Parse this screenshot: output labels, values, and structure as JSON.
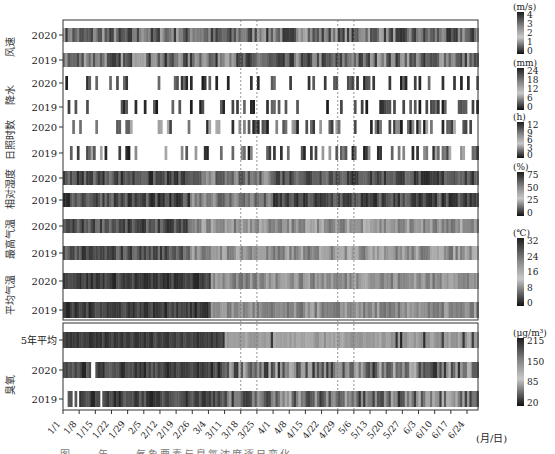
{
  "chart_data": {
    "type": "heatmap",
    "title": "",
    "xlabel": "(月/日)",
    "x_ticks": [
      "1/1",
      "1/8",
      "1/15",
      "1/22",
      "1/29",
      "2/5",
      "2/12",
      "2/19",
      "2/26",
      "3/4",
      "3/11",
      "3/18",
      "3/25",
      "4/1",
      "4/8",
      "4/15",
      "4/22",
      "4/29",
      "5/6",
      "5/13",
      "5/20",
      "5/27",
      "6/3",
      "6/10",
      "6/17",
      "6/24"
    ],
    "highlight_dashed_lines": [
      "3/18",
      "3/25",
      "4/29",
      "5/6"
    ],
    "panels": [
      {
        "name": "meteorology",
        "groups": [
          {
            "label": "风速",
            "rows": [
              "2020",
              "2019"
            ],
            "unit": "(m/s)",
            "colorbar_ticks": [
              "4",
              "3",
              "2",
              "1",
              "0"
            ],
            "range": [
              0,
              4
            ]
          },
          {
            "label": "降水",
            "rows": [
              "2020",
              "2019"
            ],
            "unit": "(mm)",
            "colorbar_ticks": [
              "24",
              "18",
              "12",
              "6",
              "0"
            ],
            "range": [
              0,
              24
            ]
          },
          {
            "label": "日照时数",
            "rows": [
              "2020",
              "2019"
            ],
            "unit": "(h)",
            "colorbar_ticks": [
              "12",
              "9",
              "6",
              "3",
              "0"
            ],
            "range": [
              0,
              12
            ]
          },
          {
            "label": "相对湿度",
            "rows": [
              "2020",
              "2019"
            ],
            "unit": "(%)",
            "colorbar_ticks": [
              "75",
              "50",
              "25",
              "0"
            ],
            "range": [
              0,
              75
            ]
          },
          {
            "label": "最高气温",
            "rows": [
              "2020",
              "2019"
            ],
            "unit": "(℃)",
            "colorbar_ticks": [
              "32",
              "24",
              "16",
              "8",
              "0"
            ],
            "range": [
              0,
              32
            ]
          },
          {
            "label": "平均气温",
            "rows": [
              "2020",
              "2019"
            ],
            "unit": "",
            "colorbar_ticks": [],
            "range": [
              0,
              32
            ]
          }
        ]
      },
      {
        "name": "ozone",
        "groups": [
          {
            "label": "臭氧",
            "rows": [
              "5年平均",
              "2020",
              "2019"
            ],
            "unit": "(μg/m³)",
            "colorbar_ticks": [
              "215",
              "150",
              "85",
              "20"
            ],
            "range": [
              20,
              215
            ]
          }
        ]
      }
    ],
    "colormap": "grayscale (dark = high)"
  },
  "caption": "图 ... 年 ... 气象要素与臭氧浓度逐日变化"
}
